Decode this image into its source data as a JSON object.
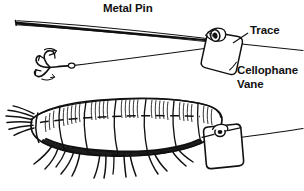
{
  "figure": {
    "background_color": "#ffffff",
    "ink_color": "#111111",
    "width": 304,
    "height": 191,
    "labels": {
      "metal_pin": "Metal Pin",
      "trace": "Trace",
      "cellophane": "Cellophane",
      "vane": "Vane"
    },
    "parts": [
      {
        "name": "metal-pin",
        "label": "Metal Pin",
        "description": "long tapered straight pin running from upper-left to the vane tag"
      },
      {
        "name": "trace",
        "label": "Trace",
        "description": "monofilament line passing through the vane and out to the right edge"
      },
      {
        "name": "treble-hook",
        "label": "",
        "description": "three-pronged treble hook with eye at the end of the lower trace"
      },
      {
        "name": "cellophane-vane",
        "label": "Cellophane Vane",
        "description": "rounded rectangular cellophane tag threaded on the trace"
      },
      {
        "name": "grub-bait",
        "label": "",
        "description": "segmented insect larva bait impaled on the pin, shown lower half"
      },
      {
        "name": "pin-path-dashes",
        "label": "",
        "description": "dashed line indicating the hidden pin path through the bait body"
      }
    ]
  }
}
